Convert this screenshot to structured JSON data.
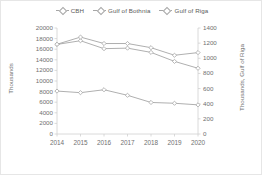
{
  "chart_data": {
    "type": "line",
    "title": "",
    "xlabel": "",
    "ylabel": "Thousands",
    "y2label": "Thousands, Gulf of Riga",
    "categories": [
      "2014",
      "2015",
      "2016",
      "2017",
      "2018",
      "2019",
      "2020"
    ],
    "x": [
      2014,
      2015,
      2016,
      2017,
      2018,
      2019,
      2020
    ],
    "ylim": [
      0,
      20000
    ],
    "y2lim": [
      0,
      1400
    ],
    "yticks": [
      0,
      2000,
      4000,
      6000,
      8000,
      10000,
      12000,
      14000,
      16000,
      18000,
      20000
    ],
    "y2ticks": [
      0,
      200,
      400,
      600,
      800,
      1000,
      1200,
      1400
    ],
    "grid": false,
    "legend_position": "top",
    "marker": "diamond",
    "line_color": "#a6a6a6",
    "marker_color": "#a6a6a6",
    "axis_color": "#d0d0d0",
    "text_color": "#707070",
    "series": [
      {
        "name": "CBH",
        "axis": "left",
        "values": [
          8100,
          7800,
          8350,
          7300,
          5950,
          5800,
          5500
        ]
      },
      {
        "name": "Gulf of Bothnia",
        "axis": "left",
        "values": [
          16900,
          17600,
          16100,
          16200,
          15400,
          13700,
          12400
        ]
      },
      {
        "name": "Gulf of Riga",
        "axis": "right",
        "values": [
          1185,
          1280,
          1195,
          1195,
          1140,
          1040,
          1075
        ]
      }
    ]
  },
  "legend": {
    "items": [
      {
        "label": "CBH"
      },
      {
        "label": "Gulf of Bothnia"
      },
      {
        "label": "Gulf of Riga"
      }
    ]
  },
  "axes": {
    "left_title": "Thousands",
    "right_title": "Thousands, Gulf of Riga"
  }
}
